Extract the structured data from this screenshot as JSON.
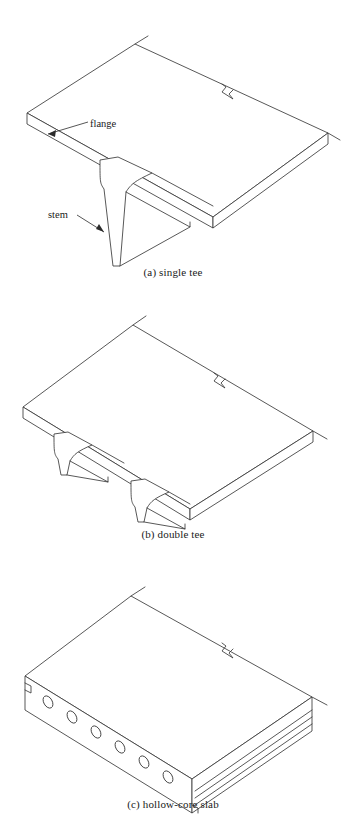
{
  "figure": {
    "background_color": "#ffffff",
    "line_color": "#3a3a3a"
  },
  "panels": [
    {
      "id": "a",
      "caption": "(a) single tee",
      "member_type": "single tee",
      "stem_count": 1,
      "break_symbol": true,
      "labels": [
        {
          "name": "flange",
          "text": "flange"
        },
        {
          "name": "stem",
          "text": "stem"
        }
      ]
    },
    {
      "id": "b",
      "caption": "(b) double tee",
      "member_type": "double tee",
      "stem_count": 2,
      "break_symbol": true,
      "labels": []
    },
    {
      "id": "c",
      "caption": "(c) hollow-core slab",
      "member_type": "hollow-core slab",
      "void_count": 6,
      "keyway_grooves": 3,
      "break_symbol": true,
      "labels": []
    }
  ]
}
